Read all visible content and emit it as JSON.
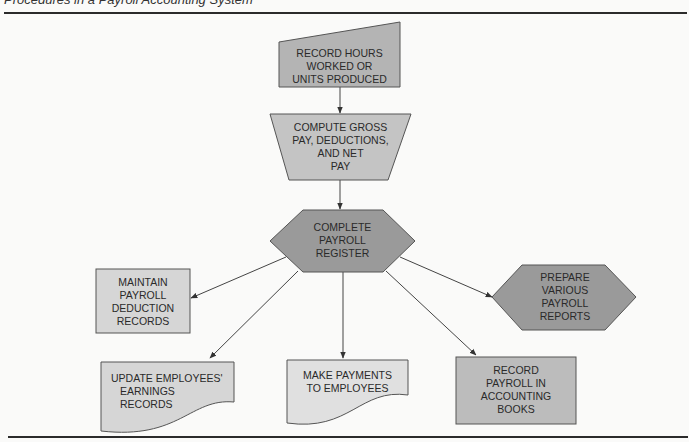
{
  "header": {
    "title": "Procedures in a Payroll Accounting System",
    "rule_color": "#2b2b2b"
  },
  "colors": {
    "background": "#fafaf9",
    "dark_shape": "#9a9a9a",
    "medium_shape": "#b4b4b4",
    "light_shape": "#d6d6d6",
    "stroke": "#555555",
    "arrow": "#333333",
    "text": "#2a2a2a"
  },
  "nodes": {
    "record_hours": {
      "shape": "manual-input",
      "lines": [
        "RECORD HOURS",
        "WORKED OR",
        "UNITS PRODUCED"
      ]
    },
    "compute_pay": {
      "shape": "trapezoid",
      "lines": [
        "COMPUTE GROSS",
        "PAY, DEDUCTIONS,",
        "AND NET",
        "PAY"
      ]
    },
    "complete_register": {
      "shape": "hexagon",
      "lines": [
        "COMPLETE",
        "PAYROLL",
        "REGISTER"
      ]
    },
    "maintain_deduction": {
      "shape": "rectangle",
      "lines": [
        "MAINTAIN",
        "PAYROLL",
        "DEDUCTION",
        "RECORDS"
      ]
    },
    "prepare_reports": {
      "shape": "hexagon",
      "lines": [
        "PREPARE",
        "VARIOUS",
        "PAYROLL",
        "REPORTS"
      ]
    },
    "update_earnings": {
      "shape": "document",
      "lines": [
        "UPDATE EMPLOYEES'",
        "EARNINGS",
        "RECORDS"
      ]
    },
    "make_payments": {
      "shape": "document",
      "lines": [
        "MAKE PAYMENTS",
        "TO EMPLOYEES"
      ]
    },
    "record_books": {
      "shape": "rectangle",
      "lines": [
        "RECORD",
        "PAYROLL IN",
        "ACCOUNTING",
        "BOOKS"
      ]
    }
  },
  "edges": [
    {
      "from": "record_hours",
      "to": "compute_pay"
    },
    {
      "from": "compute_pay",
      "to": "complete_register"
    },
    {
      "from": "complete_register",
      "to": "maintain_deduction"
    },
    {
      "from": "complete_register",
      "to": "update_earnings"
    },
    {
      "from": "complete_register",
      "to": "make_payments"
    },
    {
      "from": "complete_register",
      "to": "record_books"
    },
    {
      "from": "complete_register",
      "to": "prepare_reports"
    }
  ]
}
